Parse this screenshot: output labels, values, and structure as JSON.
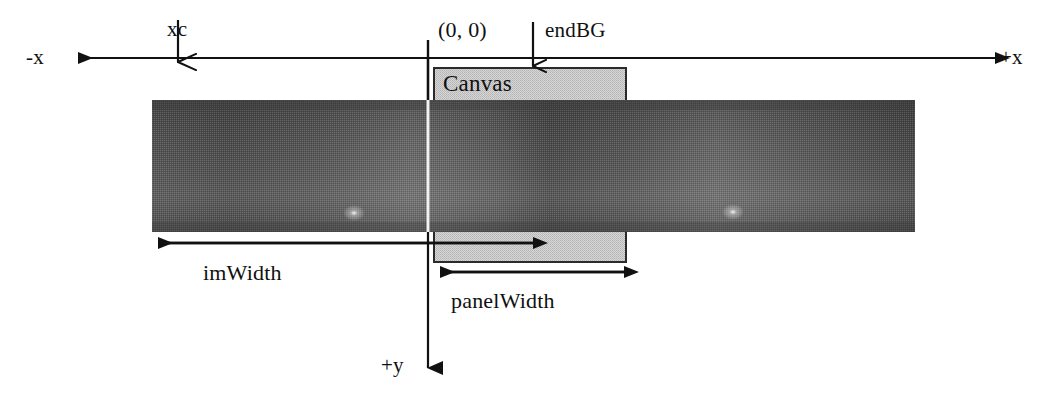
{
  "figure": {
    "type": "coordinate-system-diagram"
  },
  "axes": {
    "negative_x_label": "-x",
    "positive_x_label": "+x",
    "positive_y_label": "+y",
    "origin_label": "(0, 0)"
  },
  "markers": {
    "xc_label": "xc",
    "endbg_label": "endBG"
  },
  "regions": {
    "canvas_label": "Canvas"
  },
  "dimensions": {
    "image_width_label": "imWidth",
    "panel_width_label": "panelWidth"
  },
  "colors": {
    "line": "#111111",
    "canvas_fill": "#c8c8c8",
    "canvas_stroke": "#2b2b2b",
    "strip_dark": "#4a4a4a",
    "strip_light": "#6f6f6f",
    "background": "#ffffff"
  },
  "geometry": {
    "axis_y": 58,
    "origin_x": 428,
    "xc_x": 178,
    "endbg_x": 533,
    "strip": {
      "x": 152,
      "y": 100,
      "width": 763,
      "height": 132
    },
    "canvas_top": {
      "x": 434,
      "y": 68,
      "width": 192,
      "height": 32
    },
    "canvas_bottom": {
      "x": 434,
      "y": 232,
      "width": 192,
      "height": 30
    },
    "imwidth_arrow": {
      "x1": 155,
      "x2": 533,
      "y": 243
    },
    "panelwidth_arrow": {
      "x1": 437,
      "x2": 624,
      "y": 272
    },
    "y_axis_arrow": {
      "x": 428,
      "y1": 58,
      "y2": 383
    },
    "highlights": [
      {
        "cx": 354,
        "cy": 213
      },
      {
        "cx": 733,
        "cy": 212
      }
    ]
  }
}
